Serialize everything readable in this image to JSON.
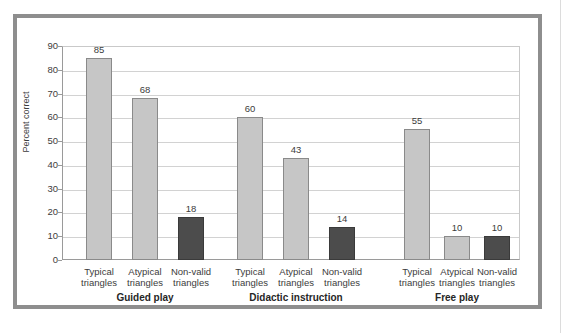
{
  "chart_data": {
    "type": "bar",
    "title": "",
    "subtitle": "",
    "xlabel": "",
    "ylabel": "Percent correct",
    "ylim": [
      0,
      90
    ],
    "ytick_step": 10,
    "yticks": [
      "90",
      "80",
      "70",
      "60",
      "50",
      "40",
      "30",
      "20",
      "10",
      "0"
    ],
    "grid": true,
    "legend": "none",
    "categories": [
      "Typical triangles",
      "Atypical triangles",
      "Non-valid triangles"
    ],
    "groups": [
      {
        "name": "Guided play",
        "bars": [
          {
            "category_line1": "Typical",
            "category_line2": "triangles",
            "value": 85,
            "label": "85",
            "style": "light"
          },
          {
            "category_line1": "Atypical",
            "category_line2": "triangles",
            "value": 68,
            "label": "68",
            "style": "light"
          },
          {
            "category_line1": "Non-valid",
            "category_line2": "triangles",
            "value": 18,
            "label": "18",
            "style": "dark"
          }
        ]
      },
      {
        "name": "Didactic instruction",
        "bars": [
          {
            "category_line1": "Typical",
            "category_line2": "triangles",
            "value": 60,
            "label": "60",
            "style": "light"
          },
          {
            "category_line1": "Atypical",
            "category_line2": "triangles",
            "value": 43,
            "label": "43",
            "style": "light"
          },
          {
            "category_line1": "Non-valid",
            "category_line2": "triangles",
            "value": 14,
            "label": "14",
            "style": "dark"
          }
        ]
      },
      {
        "name": "Free play",
        "bars": [
          {
            "category_line1": "Typical",
            "category_line2": "triangles",
            "value": 55,
            "label": "55",
            "style": "light"
          },
          {
            "category_line1": "Atypical",
            "category_line2": "triangles",
            "value": 10,
            "label": "10",
            "style": "light"
          },
          {
            "category_line1": "Non-valid",
            "category_line2": "triangles",
            "value": 10,
            "label": "10",
            "style": "dark"
          }
        ]
      }
    ],
    "colors": {
      "bar_light": "#c6c6c6",
      "bar_dark": "#4c4c4c",
      "bar_border": "#8a8a8a",
      "gridline": "#d2d2d2",
      "axis": "#9a9a9a",
      "frame": "#8e8e8e",
      "text": "#3c3c3c",
      "background": "#ffffff"
    }
  }
}
